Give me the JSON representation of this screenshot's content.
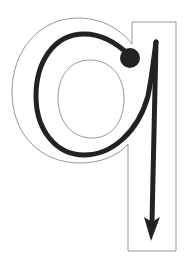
{
  "figure": {
    "letter": "q",
    "colors": {
      "background": "#ffffff",
      "outline": "#8a8a8a",
      "stroke": "#222222"
    },
    "icons": {
      "start_point": "start-dot-icon",
      "direction": "arrow-down-icon"
    }
  }
}
